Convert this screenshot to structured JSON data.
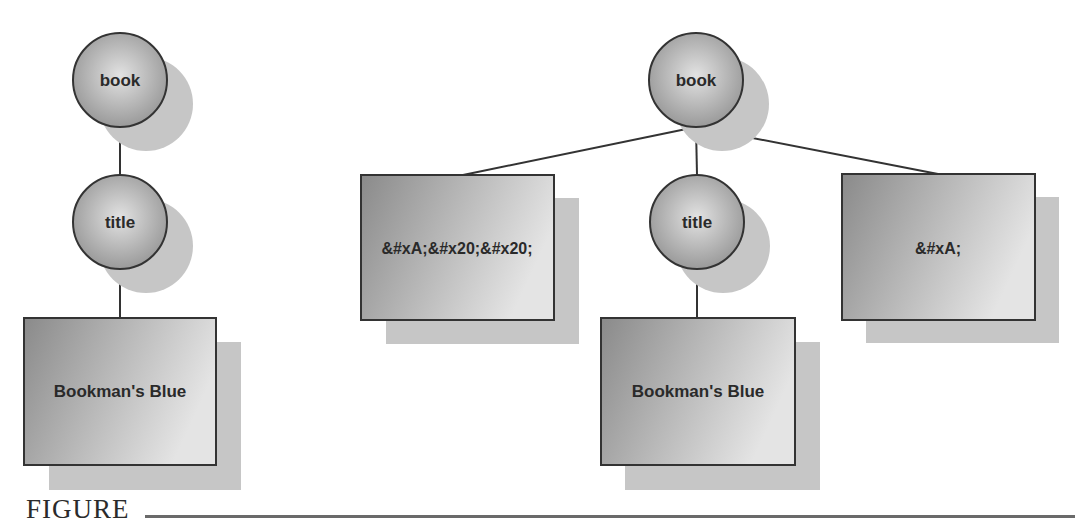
{
  "figure": {
    "caption_label": "FIGURE"
  },
  "colors": {
    "stroke": "#333333",
    "shadow": "#c4c4c4",
    "fill_dark": "#8e8e8e",
    "fill_light": "#dedede",
    "background": "#ffffff"
  },
  "left_tree": {
    "root": {
      "label": "book",
      "shape": "circle"
    },
    "child": {
      "label": "title",
      "shape": "circle"
    },
    "leaf": {
      "label": "Bookman's Blue",
      "shape": "rect"
    }
  },
  "right_tree": {
    "root": {
      "label": "book",
      "shape": "circle"
    },
    "children": [
      {
        "label": "&#xA;&#x20;&#x20;",
        "shape": "rect"
      },
      {
        "label": "title",
        "shape": "circle"
      },
      {
        "label": "&#xA;",
        "shape": "rect"
      }
    ],
    "title_leaf": {
      "label": "Bookman's Blue",
      "shape": "rect"
    }
  }
}
